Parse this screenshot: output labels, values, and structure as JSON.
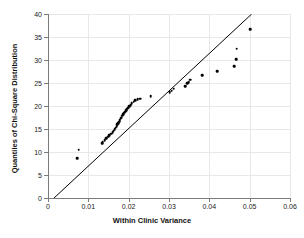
{
  "chart_data": {
    "type": "scatter",
    "title": "",
    "xlabel": "Within Clinic Variance",
    "ylabel": "Quantiles of Chi-Square Distribution",
    "xlim": [
      0,
      0.06
    ],
    "ylim": [
      0,
      40
    ],
    "xticks": [
      0,
      0.01,
      0.02,
      0.03,
      0.04,
      0.05,
      0.06
    ],
    "xticklabels": [
      "0",
      "0.01",
      "0.02",
      "0.03",
      "0.04",
      "0.05",
      "0.06"
    ],
    "yticks": [
      0,
      5,
      10,
      15,
      20,
      25,
      30,
      35,
      40
    ],
    "yticklabels": [
      "0",
      "5",
      "10",
      "15",
      "20",
      "25",
      "30",
      "35",
      "40"
    ],
    "grid": true,
    "legend": "none",
    "marker": "filled-circle",
    "marker_color": "#000000",
    "reference_line": {
      "label": "45-degree reference line",
      "color": "#000000",
      "x_start": 0.0015,
      "y_start": 0.0,
      "x_end": 0.0505,
      "y_end": 40.0
    },
    "x": [
      0.0072,
      0.0076,
      0.0134,
      0.0136,
      0.0141,
      0.0145,
      0.0149,
      0.0152,
      0.0157,
      0.016,
      0.0163,
      0.0165,
      0.0168,
      0.017,
      0.0172,
      0.0174,
      0.0176,
      0.0178,
      0.018,
      0.0182,
      0.0184,
      0.0187,
      0.0189,
      0.0191,
      0.0194,
      0.0196,
      0.0199,
      0.0202,
      0.0205,
      0.0208,
      0.0212,
      0.0216,
      0.0222,
      0.0228,
      0.0255,
      0.0302,
      0.0307,
      0.0312,
      0.034,
      0.0345,
      0.0349,
      0.0352,
      0.0383,
      0.042,
      0.0462,
      0.0466,
      0.0468,
      0.0502
    ],
    "y": [
      8.7,
      10.5,
      11.9,
      12.2,
      12.6,
      13.0,
      13.3,
      13.6,
      14.0,
      14.3,
      14.6,
      15.0,
      15.3,
      15.6,
      16.0,
      16.3,
      16.6,
      16.9,
      17.2,
      17.5,
      17.9,
      18.2,
      18.5,
      18.8,
      19.1,
      19.4,
      19.6,
      19.9,
      20.2,
      20.6,
      20.9,
      21.2,
      21.5,
      21.6,
      22.1,
      23.0,
      23.3,
      23.8,
      24.3,
      24.9,
      25.2,
      25.7,
      26.7,
      27.6,
      28.7,
      30.2,
      32.5,
      36.7
    ]
  }
}
